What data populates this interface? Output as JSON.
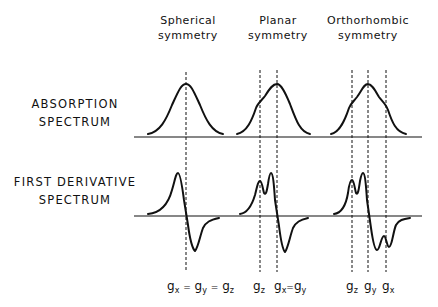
{
  "columns": [
    {
      "line1": "Spherical",
      "line2": "symmetry"
    },
    {
      "line1": "Planar",
      "line2": "symmetry"
    },
    {
      "line1": "Orthorhombic",
      "line2": "symmetry"
    }
  ],
  "rows": [
    {
      "line1": "ABSORPTION",
      "line2": "SPECTRUM"
    },
    {
      "line1": "FIRST DERIVATIVE",
      "line2": "SPECTRUM"
    }
  ],
  "g_labels": {
    "spherical": [
      {
        "base": "g",
        "sub": "x"
      },
      {
        "sep": "="
      },
      {
        "base": "g",
        "sub": "y"
      },
      {
        "sep": "="
      },
      {
        "base": "g",
        "sub": "z"
      }
    ],
    "planar_1": {
      "base": "g",
      "sub": "z"
    },
    "planar_2_a": {
      "base": "g",
      "sub": "x"
    },
    "planar_2_sep": "=",
    "planar_2_b": {
      "base": "g",
      "sub": "y"
    },
    "ortho_1": {
      "base": "g",
      "sub": "z"
    },
    "ortho_2": {
      "base": "g",
      "sub": "y"
    },
    "ortho_3": {
      "base": "g",
      "sub": "x"
    }
  },
  "colors": {
    "line": "#111111",
    "background": "#ffffff"
  }
}
